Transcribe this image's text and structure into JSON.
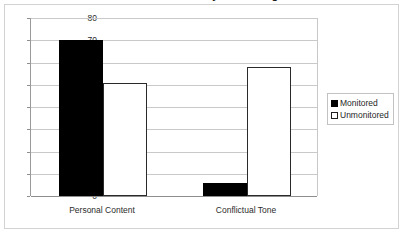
{
  "figure": {
    "title_clipped": "Differences in Disclosure by Monitoring Condition",
    "border_color": "#d2d2d2",
    "background": "#ffffff"
  },
  "chart_data": {
    "type": "bar",
    "title": "",
    "xlabel": "",
    "ylabel": "",
    "categories": [
      "Personal Content",
      "Conflictual Tone"
    ],
    "series": [
      {
        "name": "Monitored",
        "values": [
          70,
          6
        ],
        "color": "#000000"
      },
      {
        "name": "Unmonitored",
        "values": [
          51,
          58
        ],
        "color": "#ffffff"
      }
    ],
    "ylim": [
      0,
      80
    ],
    "yticks": [
      0,
      10,
      20,
      30,
      40,
      50,
      60,
      70,
      80
    ],
    "ytick_labels": [
      "0",
      "10",
      "20",
      "30",
      "40",
      "50",
      "60",
      "70",
      "80"
    ],
    "grid": true,
    "grid_axis": "y",
    "legend_position": "right",
    "legend_entries": [
      "Monitored",
      "Unmonitored"
    ]
  }
}
